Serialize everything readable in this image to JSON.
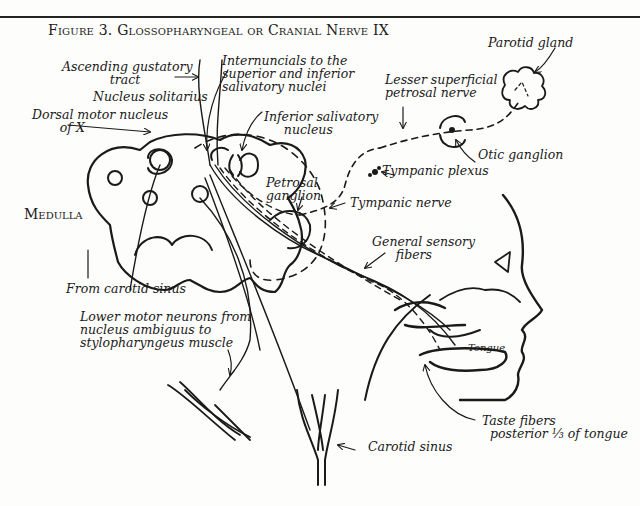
{
  "figure": {
    "title": "Figure 3. Glossopharyngeal or Cranial Nerve IX",
    "region_label": "Medulla"
  },
  "labels": {
    "ascending_gustatory_tract": "Ascending gustatory\n            tract",
    "nucleus_solitarius": "Nucleus solitarius",
    "dorsal_motor_nucleus": "Dorsal motor nucleus\n       of X",
    "internuncials": "Internuncials to the\nsuperior and inferior\nsalivatory nuclei",
    "inferior_salivatory_nucleus": "Inferior salivatory\n     nucleus",
    "lesser_superficial_petrosal_nerve": "Lesser superficial\npetrosal nerve",
    "parotid_gland": "Parotid gland",
    "otic_ganglion": "Otic ganglion",
    "tympanic_plexus": "Tympanic plexus",
    "petrosal_ganglion": "Petrosal\nganglion",
    "tympanic_nerve": "Tympanic nerve",
    "general_sensory_fibers": "General sensory\n      fibers",
    "from_carotid_sinus": "From carotid sinus",
    "lower_motor_neurons": "Lower motor neurons from\nnucleus ambiguus to\nstylopharyngeus muscle",
    "tongue": "Tongue",
    "carotid_sinus": "Carotid sinus",
    "taste_fibers": "Taste fibers\n  posterior ⅓ of tongue"
  },
  "colors": {
    "ink": "#1a1a1a",
    "paper": "#fdfdfb"
  }
}
